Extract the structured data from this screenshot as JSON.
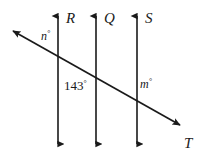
{
  "figure": {
    "type": "geometry-diagram",
    "background_color": "#ffffff",
    "stroke_color": "#1a1a1a"
  },
  "lines": {
    "vertical": [
      {
        "id": "R",
        "label": "R",
        "x": 58,
        "y_top": 11,
        "y_bottom": 149,
        "label_x": 66,
        "label_y": 23,
        "arrow_top": true,
        "arrow_bottom": true
      },
      {
        "id": "Q",
        "label": "Q",
        "x": 96,
        "y_top": 11,
        "y_bottom": 149,
        "label_x": 104,
        "label_y": 23,
        "arrow_top": true,
        "arrow_bottom": true
      },
      {
        "id": "S",
        "label": "S",
        "x": 137,
        "y_top": 11,
        "y_bottom": 149,
        "label_x": 145,
        "label_y": 23,
        "arrow_top": true,
        "arrow_bottom": true
      }
    ],
    "transversal": {
      "id": "T",
      "label": "T",
      "x1": 8,
      "y1": 28,
      "x2": 185,
      "y2": 128,
      "label_x": 184,
      "label_y": 148,
      "arrow_start": true,
      "arrow_end": true
    }
  },
  "intersections": [
    {
      "line": "R",
      "x": 58,
      "y": 50
    },
    {
      "line": "Q",
      "x": 96,
      "y": 70
    },
    {
      "line": "S",
      "x": 137,
      "y": 91
    }
  ],
  "angle_labels": [
    {
      "id": "n",
      "text": "n",
      "degree": "°",
      "style": "italic",
      "x": 41,
      "y": 40,
      "position": "left of line R, above transversal"
    },
    {
      "id": "143",
      "text": "143",
      "degree": "°",
      "style": "plain",
      "x": 64,
      "y": 90,
      "position": "left of line Q, below transversal"
    },
    {
      "id": "m",
      "text": "m",
      "degree": "°",
      "style": "italic",
      "x": 140,
      "y": 88,
      "position": "right of line S, above transversal"
    }
  ]
}
